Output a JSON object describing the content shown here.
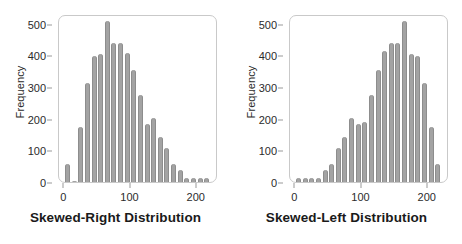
{
  "figure": {
    "background_color": "#ffffff",
    "bar_color": "#a3a3a3",
    "axis_color": "#c9c9c9",
    "text_color": "#2b2b2b"
  },
  "panels": [
    {
      "caption": "Skewed-Right Distribution",
      "ylabel": "Frequency",
      "yticks": [
        "0",
        "100",
        "200",
        "300",
        "400",
        "500"
      ],
      "xticks": [
        "0",
        "100",
        "200"
      ]
    },
    {
      "caption": "Skewed-Left Distribution",
      "ylabel": "Frequency",
      "yticks": [
        "0",
        "100",
        "200",
        "300",
        "400",
        "500"
      ],
      "xticks": [
        "0",
        "100",
        "200"
      ]
    }
  ],
  "chart_data": [
    {
      "type": "bar",
      "title": "Skewed-Right Distribution",
      "xlabel": "",
      "ylabel": "Frequency",
      "xlim": [
        -8,
        232
      ],
      "ylim": [
        0,
        530
      ],
      "yticks": [
        0,
        100,
        200,
        300,
        400,
        500
      ],
      "xticks": [
        0,
        100,
        200
      ],
      "grid": false,
      "legend": false,
      "bin_width": 10,
      "categories": [
        5,
        15,
        25,
        35,
        45,
        55,
        65,
        75,
        85,
        95,
        105,
        115,
        125,
        135,
        145,
        155,
        165,
        175,
        185,
        195,
        205,
        215
      ],
      "values": [
        55,
        0,
        170,
        310,
        395,
        400,
        505,
        435,
        435,
        405,
        350,
        270,
        180,
        200,
        140,
        105,
        55,
        35,
        10,
        10,
        10,
        10
      ]
    },
    {
      "type": "bar",
      "title": "Skewed-Left Distribution",
      "xlabel": "",
      "ylabel": "Frequency",
      "xlim": [
        -8,
        232
      ],
      "ylim": [
        0,
        530
      ],
      "yticks": [
        0,
        100,
        200,
        300,
        400,
        500
      ],
      "xticks": [
        0,
        100,
        200
      ],
      "grid": false,
      "legend": false,
      "bin_width": 10,
      "categories": [
        5,
        15,
        25,
        35,
        45,
        55,
        65,
        75,
        85,
        95,
        105,
        115,
        125,
        135,
        145,
        155,
        165,
        175,
        185,
        195,
        205,
        215
      ],
      "values": [
        10,
        10,
        10,
        10,
        35,
        55,
        105,
        140,
        200,
        180,
        185,
        270,
        350,
        410,
        435,
        435,
        505,
        400,
        395,
        310,
        170,
        55
      ]
    }
  ]
}
